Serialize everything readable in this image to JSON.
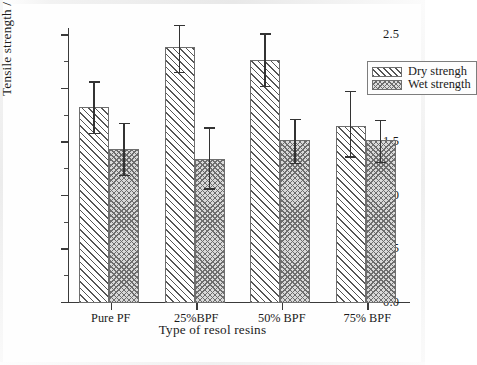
{
  "chart_data": {
    "type": "bar",
    "title": "",
    "xlabel": "Type of resol resins",
    "ylabel": "Tensile strength / MPa",
    "categories": [
      "Pure PF",
      "25%BPF",
      "50% BPF",
      "75% BPF"
    ],
    "ylim": [
      0.0,
      2.5
    ],
    "ytick_labels": [
      "0.0",
      "0.5",
      "1.0",
      "1.5",
      "2.0",
      "2.5"
    ],
    "ytick_values": [
      0.0,
      0.5,
      1.0,
      1.5,
      2.0,
      2.5
    ],
    "yminor_step": 0.25,
    "grid": false,
    "legend_position": "top-right",
    "series": [
      {
        "name": "Dry strengh",
        "pattern": "diagonal-hatch",
        "values": [
          1.83,
          2.39,
          2.27,
          1.65
        ],
        "err_upper": [
          2.06,
          2.59,
          2.51,
          1.97
        ],
        "err_lower": [
          1.58,
          2.15,
          2.02,
          1.36
        ]
      },
      {
        "name": "Wet strength",
        "pattern": "cross-hatch",
        "values": [
          1.44,
          1.35,
          1.52,
          1.52
        ],
        "err_upper": [
          1.67,
          1.63,
          1.71,
          1.7
        ],
        "err_lower": [
          1.19,
          1.06,
          1.3,
          1.31
        ]
      }
    ]
  },
  "legend": {
    "entries": [
      {
        "label": "Dry strengh",
        "swatch": "diagonal-hatch-swatch"
      },
      {
        "label": "Wet strength",
        "swatch": "cross-hatch-swatch"
      }
    ]
  },
  "colors": {
    "axis": "#3a3a3a",
    "bar_outline": "#6e6e6e",
    "hatch": "#555555",
    "wet_fill": "#d9d9d9",
    "error_bar": "#333333",
    "background": "#fefefe"
  }
}
